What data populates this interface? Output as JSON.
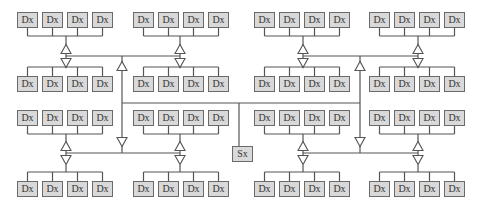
{
  "diagram": {
    "type": "bus-hierarchy",
    "node_label": "Dx",
    "switch_label": "Sx",
    "colors": {
      "box_fill": "#d9d9d9",
      "box_border": "#6a6a6a",
      "line": "#555555"
    },
    "groups": [
      {
        "id": "g1",
        "x": 17,
        "rows": [
          12,
          76
        ],
        "nodes": [
          "Dx",
          "Dx",
          "Dx",
          "Dx"
        ]
      },
      {
        "id": "g2",
        "x": 133,
        "rows": [
          12,
          76
        ],
        "nodes": [
          "Dx",
          "Dx",
          "Dx",
          "Dx"
        ]
      },
      {
        "id": "g3",
        "x": 254,
        "rows": [
          12,
          76
        ],
        "nodes": [
          "Dx",
          "Dx",
          "Dx",
          "Dx"
        ]
      },
      {
        "id": "g4",
        "x": 369,
        "rows": [
          12,
          76
        ],
        "nodes": [
          "Dx",
          "Dx",
          "Dx",
          "Dx"
        ]
      },
      {
        "id": "g5",
        "x": 17,
        "rows": [
          110,
          181
        ],
        "nodes": [
          "Dx",
          "Dx",
          "Dx",
          "Dx"
        ]
      },
      {
        "id": "g6",
        "x": 133,
        "rows": [
          110,
          181
        ],
        "nodes": [
          "Dx",
          "Dx",
          "Dx",
          "Dx"
        ]
      },
      {
        "id": "g7",
        "x": 254,
        "rows": [
          110,
          181
        ],
        "nodes": [
          "Dx",
          "Dx",
          "Dx",
          "Dx"
        ]
      },
      {
        "id": "g8",
        "x": 369,
        "rows": [
          110,
          181
        ],
        "nodes": [
          "Dx",
          "Dx",
          "Dx",
          "Dx"
        ]
      }
    ],
    "switch": {
      "label": "Sx",
      "x": 232,
      "y": 146
    }
  }
}
